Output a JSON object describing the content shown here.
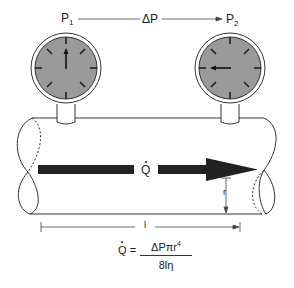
{
  "labels": {
    "p1": "P",
    "p1_sub": "1",
    "delta_p": "ΔP",
    "p2": "P",
    "p2_sub": "2",
    "flow": "Q",
    "radius": "r",
    "length": "l"
  },
  "formula": {
    "lhs": "Q",
    "equals": "=",
    "numerator": "ΔPπr",
    "numerator_exp": "4",
    "denominator": "8lη"
  },
  "colors": {
    "gauge_face": "#9a9a9a",
    "stroke": "#333333",
    "arrow": "#222222"
  },
  "gauges": [
    {
      "name": "gauge-p1",
      "needle_direction": "up"
    },
    {
      "name": "gauge-p2",
      "needle_direction": "left"
    }
  ]
}
